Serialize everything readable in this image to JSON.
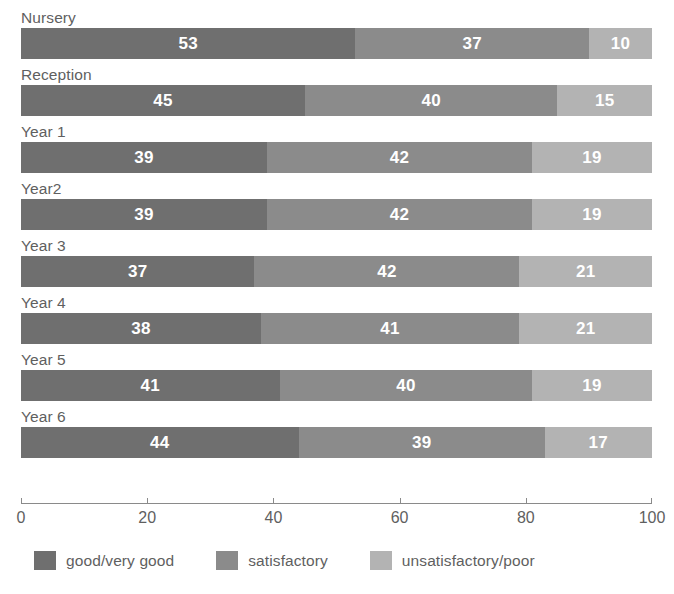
{
  "chart_data": {
    "type": "bar",
    "orientation": "horizontal",
    "stacked": true,
    "stack_mode": "percent",
    "title": "",
    "subtitle": "",
    "xlabel": "",
    "ylabel": "",
    "xlim": [
      0,
      100
    ],
    "xticks": [
      0,
      20,
      40,
      60,
      80,
      100
    ],
    "xtick_labels": [
      "0",
      "20",
      "40",
      "60",
      "80",
      "100"
    ],
    "grid": false,
    "legend_position": "bottom-left",
    "categories": [
      "Nursery",
      "Reception",
      "Year 1",
      "Year2",
      "Year 3",
      "Year 4",
      "Year 5",
      "Year 6"
    ],
    "series": [
      {
        "name": "good/very good",
        "color": "#6f6f6f",
        "values": [
          53,
          45,
          39,
          39,
          37,
          38,
          41,
          44
        ]
      },
      {
        "name": "satisfactory",
        "color": "#8b8b8b",
        "values": [
          37,
          40,
          42,
          42,
          42,
          41,
          40,
          39
        ]
      },
      {
        "name": "unsatisfactory/poor",
        "color": "#b3b3b3",
        "values": [
          10,
          15,
          19,
          19,
          21,
          21,
          19,
          17
        ]
      }
    ],
    "data_labels": [
      {
        "category": "Nursery",
        "values": [
          "53",
          "37",
          "10"
        ]
      },
      {
        "category": "Reception",
        "values": [
          "45",
          "40",
          "15"
        ]
      },
      {
        "category": "Year 1",
        "values": [
          "39",
          "42",
          "19"
        ]
      },
      {
        "category": "Year2",
        "values": [
          "39",
          "42",
          "19"
        ]
      },
      {
        "category": "Year 3",
        "values": [
          "37",
          "42",
          "21"
        ]
      },
      {
        "category": "Year 4",
        "values": [
          "38",
          "41",
          "21"
        ]
      },
      {
        "category": "Year 5",
        "values": [
          "41",
          "40",
          "19"
        ]
      },
      {
        "category": "Year 6",
        "values": [
          "44",
          "39",
          "17"
        ]
      }
    ]
  }
}
